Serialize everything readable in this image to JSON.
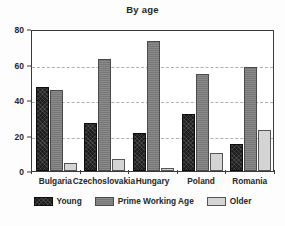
{
  "chart_data": {
    "type": "bar",
    "title": "By age",
    "xlabel": "",
    "ylabel": "",
    "ylim": [
      0,
      80
    ],
    "yticks": [
      0,
      20,
      40,
      60,
      80
    ],
    "grid": "horizontal-dashed",
    "legend_position": "bottom-center",
    "categories": [
      "Bulgaria",
      "Czechoslovakia",
      "Hungary",
      "Poland",
      "Romania"
    ],
    "series": [
      {
        "name": "Young",
        "color": "#1c1c1c",
        "values": [
          47.5,
          27,
          21.5,
          32,
          15
        ]
      },
      {
        "name": "Prime Working Age",
        "color": "#7d7d7d",
        "values": [
          45.5,
          63,
          73.5,
          54.5,
          58.5
        ]
      },
      {
        "name": "Older",
        "color": "#d4d4d4",
        "values": [
          4.5,
          6.5,
          1.5,
          10,
          23
        ]
      }
    ]
  }
}
